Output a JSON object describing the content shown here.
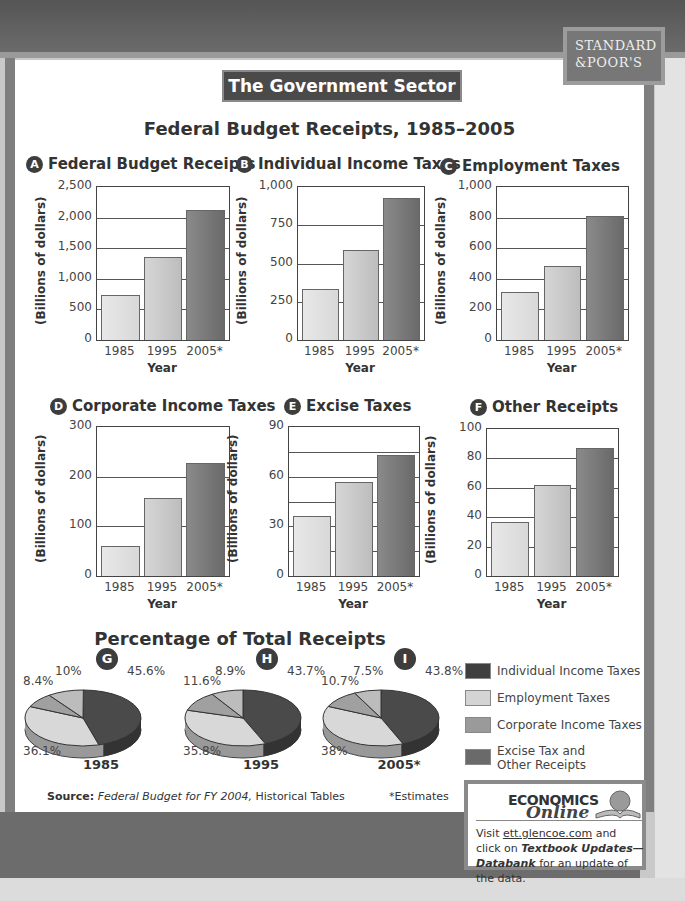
{
  "badge": {
    "line1": "STANDARD",
    "line2": "&POOR'S"
  },
  "header": {
    "section_title": "The Government Sector",
    "main_title": "Federal Budget Receipts, 1985–2005"
  },
  "axis": {
    "ylabel": "(Billions of dollars)",
    "xlabel": "Year",
    "categories": [
      "1985",
      "1995",
      "2005*"
    ]
  },
  "charts": [
    {
      "letter": "A",
      "title": "Federal Budget Receipts",
      "ticks": [
        "2,500",
        "2,000",
        "1,500",
        "1,000",
        "500",
        "0"
      ],
      "ymax": 2500,
      "values": [
        734,
        1351,
        2121
      ]
    },
    {
      "letter": "B",
      "title": "Individual Income Taxes",
      "ticks": [
        "1,000",
        "750",
        "500",
        "250",
        "0"
      ],
      "ymax": 1000,
      "values": [
        335,
        590,
        930
      ]
    },
    {
      "letter": "C",
      "title": "Employment Taxes",
      "ticks": [
        "1,000",
        "800",
        "600",
        "400",
        "200",
        "0"
      ],
      "ymax": 1000,
      "values": [
        311,
        484,
        812
      ]
    },
    {
      "letter": "D",
      "title": "Corporate Income Taxes",
      "ticks": [
        "300",
        "200",
        "100",
        "0"
      ],
      "ymax": 300,
      "values": [
        61,
        157,
        228
      ]
    },
    {
      "letter": "E",
      "title": "Excise Taxes",
      "ticks": [
        "90",
        "60",
        "30",
        "0"
      ],
      "ymax": 90,
      "values": [
        36,
        57,
        73
      ]
    },
    {
      "letter": "F",
      "title": "Other Receipts",
      "ticks": [
        "100",
        "80",
        "60",
        "40",
        "20",
        "0"
      ],
      "ymax": 100,
      "values": [
        37,
        62,
        87
      ]
    }
  ],
  "pies": {
    "title": "Percentage of Total Receipts",
    "items": [
      {
        "letter": "G",
        "year": "1985",
        "labels": {
          "ind": "45.6%",
          "emp": "36.1%",
          "corp": "8.4%",
          "other": "10%"
        }
      },
      {
        "letter": "H",
        "year": "1995",
        "labels": {
          "ind": "43.7%",
          "emp": "35.8%",
          "corp": "11.6%",
          "other": "8.9%"
        }
      },
      {
        "letter": "I",
        "year": "2005*",
        "labels": {
          "ind": "43.8%",
          "emp": "38%",
          "corp": "10.7%",
          "other": "7.5%"
        }
      }
    ]
  },
  "legend": [
    {
      "label": "Individual Income Taxes",
      "color": "#3f3f3f"
    },
    {
      "label": "Employment Taxes",
      "color": "#d4d4d4"
    },
    {
      "label": "Corporate Income Taxes",
      "color": "#9a9a9a"
    },
    {
      "label": "Excise Tax and",
      "label2": "Other Receipts",
      "color": "#6a6a6a"
    }
  ],
  "footer": {
    "source_label": "Source:",
    "source_title": "Federal Budget for FY 2004,",
    "source_rest": " Historical Tables",
    "estimates": "*Estimates"
  },
  "econ": {
    "logo": "ECONOMICS",
    "online": "Online",
    "visit": "Visit ",
    "link": "ett.glencoe.com",
    "mid": " and click on ",
    "emph": "Textbook Updates—Databank",
    "end": " for an update of the data."
  },
  "chart_data": [
    {
      "type": "bar",
      "title": "Federal Budget Receipts",
      "categories": [
        "1985",
        "1995",
        "2005*"
      ],
      "values": [
        734,
        1351,
        2121
      ],
      "xlabel": "Year",
      "ylabel": "(Billions of dollars)",
      "ylim": [
        0,
        2500
      ]
    },
    {
      "type": "bar",
      "title": "Individual Income Taxes",
      "categories": [
        "1985",
        "1995",
        "2005*"
      ],
      "values": [
        335,
        590,
        930
      ],
      "xlabel": "Year",
      "ylabel": "(Billions of dollars)",
      "ylim": [
        0,
        1000
      ]
    },
    {
      "type": "bar",
      "title": "Employment Taxes",
      "categories": [
        "1985",
        "1995",
        "2005*"
      ],
      "values": [
        311,
        484,
        812
      ],
      "xlabel": "Year",
      "ylabel": "(Billions of dollars)",
      "ylim": [
        0,
        1000
      ]
    },
    {
      "type": "bar",
      "title": "Corporate Income Taxes",
      "categories": [
        "1985",
        "1995",
        "2005*"
      ],
      "values": [
        61,
        157,
        228
      ],
      "xlabel": "Year",
      "ylabel": "(Billions of dollars)",
      "ylim": [
        0,
        300
      ]
    },
    {
      "type": "bar",
      "title": "Excise Taxes",
      "categories": [
        "1985",
        "1995",
        "2005*"
      ],
      "values": [
        36,
        57,
        73
      ],
      "xlabel": "Year",
      "ylabel": "(Billions of dollars)",
      "ylim": [
        0,
        90
      ]
    },
    {
      "type": "bar",
      "title": "Other Receipts",
      "categories": [
        "1985",
        "1995",
        "2005*"
      ],
      "values": [
        37,
        62,
        87
      ],
      "xlabel": "Year",
      "ylabel": "(Billions of dollars)",
      "ylim": [
        0,
        100
      ]
    },
    {
      "type": "pie",
      "title": "1985",
      "categories": [
        "Individual Income Taxes",
        "Employment Taxes",
        "Corporate Income Taxes",
        "Excise Tax and Other Receipts"
      ],
      "values": [
        45.6,
        36.1,
        8.4,
        10
      ]
    },
    {
      "type": "pie",
      "title": "1995",
      "categories": [
        "Individual Income Taxes",
        "Employment Taxes",
        "Corporate Income Taxes",
        "Excise Tax and Other Receipts"
      ],
      "values": [
        43.7,
        35.8,
        11.6,
        8.9
      ]
    },
    {
      "type": "pie",
      "title": "2005*",
      "categories": [
        "Individual Income Taxes",
        "Employment Taxes",
        "Corporate Income Taxes",
        "Excise Tax and Other Receipts"
      ],
      "values": [
        43.8,
        38,
        10.7,
        7.5
      ]
    }
  ]
}
